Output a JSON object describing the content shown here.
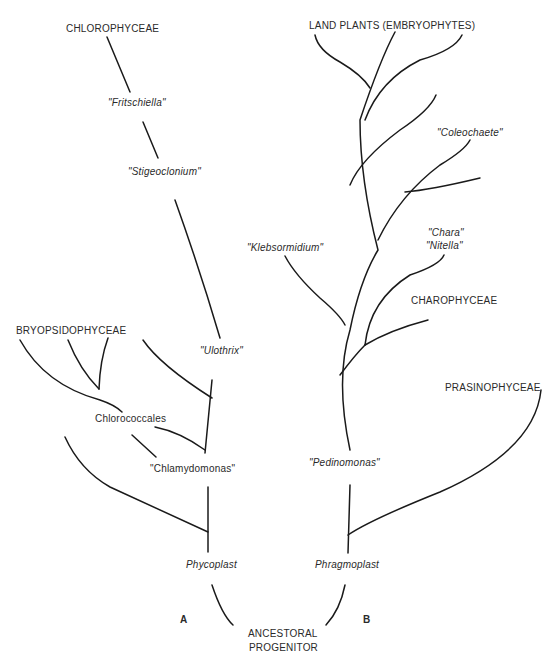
{
  "diagram": {
    "panels": {
      "a": "A",
      "b": "B"
    },
    "root": {
      "line1": "ANCESTORAL",
      "line2": "PROGENITOR"
    },
    "tree_a": {
      "base_label": "Phycoplast",
      "labels": {
        "chlorophyceae": "CHLOROPHYCEAE",
        "fritschiella": "\"Fritschiella\"",
        "stigeoclonium": "\"Stigeoclonium\"",
        "ulothrix": "\"Ulothrix\"",
        "bryopsidophyceae": "BRYOPSIDOPHYCEAE",
        "chlorococcales": "Chlorococcales",
        "chlamydomonas": "\"Chlamydomonas\""
      }
    },
    "tree_b": {
      "base_label": "Phragmoplast",
      "labels": {
        "land_plants": "LAND PLANTS (EMBRYOPHYTES)",
        "coleochaete": "\"Coleochaete\"",
        "chara": "\"Chara\"",
        "nitella": "\"Nitella\"",
        "klebsormidium": "\"Klebsormidium\"",
        "charophyceae": "CHAROPHYCEAE",
        "prasinophyceae": "PRASINOPHYCEAE",
        "pedinomonas": "\"Pedinomonas\""
      }
    }
  }
}
